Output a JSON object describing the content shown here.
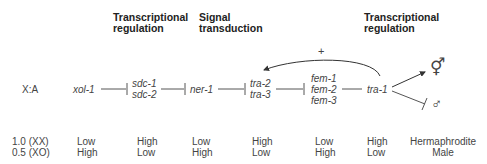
{
  "headers": {
    "transcriptional_1": [
      "Transcriptional",
      "regulation"
    ],
    "signal": [
      "Signal",
      "transduction"
    ],
    "transcriptional_2": [
      "Transcriptional",
      "regulation"
    ]
  },
  "row_label": "X:A",
  "genes": {
    "xol": "xol-1",
    "sdc": [
      "sdc-1",
      "sdc-2"
    ],
    "ner": "ner-1",
    "tra23": [
      "tra-2",
      "tra-3"
    ],
    "fem": [
      "fem-1",
      "fem-2",
      "fem-3"
    ],
    "tra1": "tra-1"
  },
  "feedback_label": "+",
  "outcomes": {
    "hermaphrodite_symbol": "⚥",
    "male_symbol": "♂"
  },
  "table": {
    "ratios": [
      "1.0 (XX)",
      "0.5 (XO)"
    ],
    "xol": [
      "Low",
      "High"
    ],
    "sdc": [
      "High",
      "Low"
    ],
    "ner": [
      "Low",
      "High"
    ],
    "tra23": [
      "High",
      "Low"
    ],
    "fem": [
      "Low",
      "High"
    ],
    "tra1": [
      "High",
      "Low"
    ],
    "sex": [
      "Hermaphrodite",
      "Male"
    ]
  },
  "colors": {
    "line": "#555555",
    "text": "#444444",
    "header": "#222222"
  }
}
